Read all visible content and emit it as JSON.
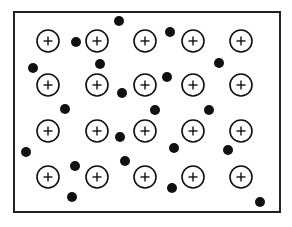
{
  "diagram": {
    "box": {
      "x": 14,
      "y": 12,
      "width": 266,
      "height": 200,
      "stroke": "#222222"
    },
    "ion_label": "+",
    "ion_radius": 11,
    "electron_radius": 5,
    "ions": [
      {
        "x": 48,
        "y": 41
      },
      {
        "x": 97,
        "y": 41
      },
      {
        "x": 145,
        "y": 41
      },
      {
        "x": 193,
        "y": 41
      },
      {
        "x": 241,
        "y": 41
      },
      {
        "x": 48,
        "y": 85
      },
      {
        "x": 97,
        "y": 85
      },
      {
        "x": 145,
        "y": 85
      },
      {
        "x": 193,
        "y": 85
      },
      {
        "x": 241,
        "y": 85
      },
      {
        "x": 48,
        "y": 131
      },
      {
        "x": 97,
        "y": 131
      },
      {
        "x": 145,
        "y": 131
      },
      {
        "x": 193,
        "y": 131
      },
      {
        "x": 241,
        "y": 131
      },
      {
        "x": 48,
        "y": 177
      },
      {
        "x": 97,
        "y": 177
      },
      {
        "x": 145,
        "y": 177
      },
      {
        "x": 193,
        "y": 177
      },
      {
        "x": 241,
        "y": 177
      }
    ],
    "electrons": [
      {
        "x": 76,
        "y": 42
      },
      {
        "x": 119,
        "y": 21
      },
      {
        "x": 170,
        "y": 32
      },
      {
        "x": 33,
        "y": 68
      },
      {
        "x": 100,
        "y": 64
      },
      {
        "x": 219,
        "y": 63
      },
      {
        "x": 122,
        "y": 93
      },
      {
        "x": 167,
        "y": 77
      },
      {
        "x": 65,
        "y": 109
      },
      {
        "x": 155,
        "y": 110
      },
      {
        "x": 209,
        "y": 110
      },
      {
        "x": 26,
        "y": 152
      },
      {
        "x": 120,
        "y": 137
      },
      {
        "x": 174,
        "y": 148
      },
      {
        "x": 228,
        "y": 150
      },
      {
        "x": 75,
        "y": 166
      },
      {
        "x": 125,
        "y": 161
      },
      {
        "x": 72,
        "y": 197
      },
      {
        "x": 172,
        "y": 188
      },
      {
        "x": 260,
        "y": 202
      }
    ],
    "colors": {
      "ion_stroke": "#111111",
      "electron_fill": "#111111",
      "background": "#ffffff"
    }
  }
}
